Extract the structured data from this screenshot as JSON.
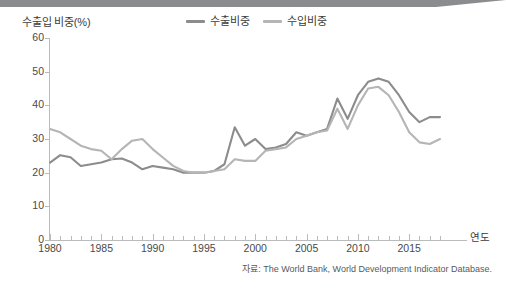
{
  "axis_title": "수출입 비중(%)",
  "x_axis_name": "연도",
  "source_note": "자료: The World Bank, World Development Indicator Database.",
  "legend": {
    "items": [
      {
        "label": "수출비중",
        "color": "#8c8c8c"
      },
      {
        "label": "수입비중",
        "color": "#b5b5b5"
      }
    ]
  },
  "colors": {
    "export_line": "#8c8c8c",
    "import_line": "#b5b5b5",
    "axis": "#b9bbbd",
    "text": "#3b3b3b",
    "tick_text": "#4a4a4a",
    "band": "#8a8c8e"
  },
  "chart_data": {
    "type": "line",
    "title": "수출입 비중(%)",
    "xlabel": "연도",
    "ylabel": "수출입 비중(%)",
    "xlim": [
      1980,
      2018
    ],
    "ylim": [
      0,
      60
    ],
    "ytick_labels": [
      "0",
      "10",
      "20",
      "30",
      "40",
      "50",
      "60"
    ],
    "yticks": [
      0,
      10,
      20,
      30,
      40,
      50,
      60
    ],
    "xtick_labels": [
      "1980",
      "1985",
      "1990",
      "1995",
      "2000",
      "2005",
      "2010",
      "2015"
    ],
    "xticks": [
      1980,
      1985,
      1990,
      1995,
      2000,
      2005,
      2010,
      2015
    ],
    "xtick_minor_step": 1,
    "grid": false,
    "legend_position": "top-center",
    "x": [
      1980,
      1981,
      1982,
      1983,
      1984,
      1985,
      1986,
      1987,
      1988,
      1989,
      1990,
      1991,
      1992,
      1993,
      1994,
      1995,
      1996,
      1997,
      1998,
      1999,
      2000,
      2001,
      2002,
      2003,
      2004,
      2005,
      2006,
      2007,
      2008,
      2009,
      2010,
      2011,
      2012,
      2013,
      2014,
      2015,
      2016,
      2017,
      2018
    ],
    "series": [
      {
        "name": "수출비중",
        "color": "#8c8c8c",
        "values": [
          23.0,
          25.2,
          24.6,
          22.0,
          22.5,
          23.0,
          24.0,
          24.2,
          23.0,
          21.0,
          22.0,
          21.5,
          21.0,
          20.0,
          20.0,
          20.0,
          20.5,
          22.5,
          33.5,
          28.0,
          30.0,
          27.0,
          27.5,
          28.5,
          32.0,
          31.0,
          32.0,
          33.0,
          42.0,
          36.0,
          43.0,
          47.0,
          48.0,
          47.0,
          43.0,
          38.0,
          35.0,
          36.5,
          36.5
        ]
      },
      {
        "name": "수입비중",
        "color": "#b5b5b5",
        "values": [
          33.0,
          32.0,
          30.0,
          28.0,
          27.0,
          26.5,
          24.0,
          27.0,
          29.5,
          30.0,
          27.0,
          24.5,
          22.0,
          20.5,
          20.0,
          20.0,
          20.5,
          21.0,
          24.0,
          23.5,
          23.5,
          26.5,
          27.0,
          27.5,
          30.0,
          31.0,
          32.0,
          32.5,
          39.0,
          33.0,
          40.0,
          45.0,
          45.5,
          43.0,
          38.0,
          32.0,
          29.0,
          28.5,
          30.0
        ]
      }
    ]
  }
}
